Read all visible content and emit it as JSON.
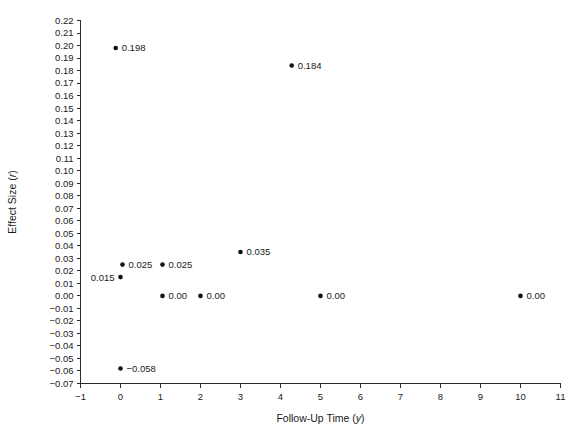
{
  "chart_data": {
    "type": "scatter",
    "title": "",
    "xlabel": "Follow-Up Time (y)",
    "xlabel_parts": {
      "text": "Follow-Up Time (",
      "italic": "y",
      "tail": ")"
    },
    "ylabel": "Effect Size (r)",
    "ylabel_parts": {
      "text": "Effect Size (",
      "italic": "r",
      "tail": ")"
    },
    "xlim": [
      -1,
      11
    ],
    "ylim": [
      -0.07,
      0.22
    ],
    "grid": false,
    "legend": false,
    "xticks": [
      "-1",
      "0",
      "1",
      "2",
      "3",
      "4",
      "5",
      "6",
      "7",
      "8",
      "9",
      "10",
      "11"
    ],
    "xtick_values": [
      -1,
      0,
      1,
      2,
      3,
      4,
      5,
      6,
      7,
      8,
      9,
      10,
      11
    ],
    "yticks": [
      "0.22",
      "0.21",
      "0.20",
      "0.19",
      "0.18",
      "0.17",
      "0.16",
      "0.15",
      "0.14",
      "0.13",
      "0.12",
      "0.11",
      "0.10",
      "0.09",
      "0.08",
      "0.07",
      "0.06",
      "0.05",
      "0.04",
      "0.03",
      "0.02",
      "0.01",
      "0.00",
      "-0.01",
      "-0.02",
      "-0.03",
      "-0.04",
      "-0.05",
      "-0.06",
      "-0.07"
    ],
    "ytick_values": [
      0.22,
      0.21,
      0.2,
      0.19,
      0.18,
      0.17,
      0.16,
      0.15,
      0.14,
      0.13,
      0.12,
      0.11,
      0.1,
      0.09,
      0.08,
      0.07,
      0.06,
      0.05,
      0.04,
      0.03,
      0.02,
      0.01,
      0.0,
      -0.01,
      -0.02,
      -0.03,
      -0.04,
      -0.05,
      -0.06,
      -0.07
    ],
    "points": [
      {
        "x": -0.12,
        "y": 0.198,
        "label": "0.198",
        "label_side": "right"
      },
      {
        "x": 4.28,
        "y": 0.184,
        "label": "0.184",
        "label_side": "right"
      },
      {
        "x": 3.0,
        "y": 0.035,
        "label": "0.035",
        "label_side": "right"
      },
      {
        "x": 0.05,
        "y": 0.025,
        "label": "0.025",
        "label_side": "right"
      },
      {
        "x": 1.05,
        "y": 0.025,
        "label": "0.025",
        "label_side": "right"
      },
      {
        "x": 0.0,
        "y": 0.015,
        "label": "0.015",
        "label_side": "left"
      },
      {
        "x": 1.05,
        "y": 0.0,
        "label": "0.00",
        "label_side": "right"
      },
      {
        "x": 2.0,
        "y": 0.0,
        "label": "0.00",
        "label_side": "right"
      },
      {
        "x": 5.0,
        "y": 0.0,
        "label": "0.00",
        "label_side": "right"
      },
      {
        "x": 10.0,
        "y": 0.0,
        "label": "0.00",
        "label_side": "right"
      },
      {
        "x": 0.0,
        "y": -0.058,
        "label": "-0.058",
        "label_side": "right"
      }
    ]
  }
}
